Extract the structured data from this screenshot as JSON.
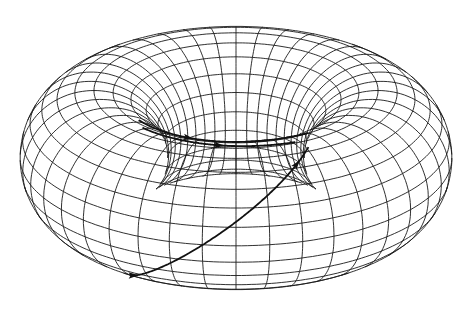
{
  "figure": {
    "title": "",
    "background": "#ffffff",
    "line_color": "#1a1a1a",
    "trajectory_color": "#111111"
  },
  "torus": {
    "major_radius": 1.0,
    "minor_radius": 0.52,
    "toroidal_divisions": 40,
    "poloidal_divisions": 24,
    "view_elevation_deg": 24,
    "view_azimuth_deg": 0,
    "center_px": [
      236,
      158
    ],
    "scale_px": 142
  },
  "trajectories": [
    {
      "label": "outer helical trajectory",
      "phi_start": 3.55,
      "phi_end": 5.2,
      "theta_start": -2.2,
      "theta_end": 1.4,
      "arrows": [
        0.35,
        0.92
      ]
    },
    {
      "label": "inner trajectory 1",
      "phi_start": 3.9,
      "phi_end": 5.15,
      "theta_start": 1.75,
      "theta_end": 1.6,
      "arrows": [
        0.55
      ]
    },
    {
      "label": "inner trajectory 2",
      "phi_start": 3.7,
      "phi_end": 5.0,
      "theta_start": 1.95,
      "theta_end": 1.95,
      "arrows": [
        0.45
      ]
    },
    {
      "label": "inner trajectory 3",
      "phi_start": 3.75,
      "phi_end": 5.35,
      "theta_start": 2.25,
      "theta_end": 1.85,
      "arrows": [
        0.6
      ]
    },
    {
      "label": "inner trajectory 4",
      "phi_start": 3.9,
      "phi_end": 5.5,
      "theta_start": 2.6,
      "theta_end": 2.45,
      "arrows": [
        0.55
      ]
    },
    {
      "label": "inner trajectory 5",
      "phi_start": 4.0,
      "phi_end": 5.45,
      "theta_start": 2.8,
      "theta_end": 2.75,
      "arrows": [
        0.4,
        0.75
      ]
    }
  ]
}
